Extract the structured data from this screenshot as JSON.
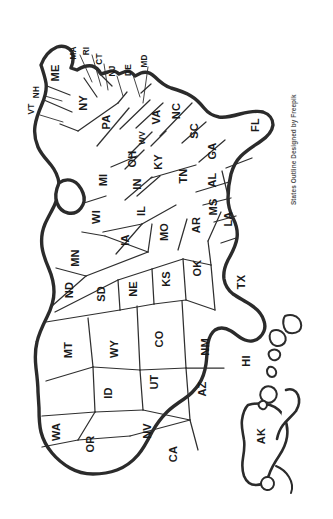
{
  "document": {
    "title": "United States Outline Map",
    "orientation": "rotated-90-clockwise",
    "background_color": "#ffffff",
    "outline_color": "#2b2b2b",
    "state_border_color": "#2f2f2f",
    "label_color": "#1a1a1a"
  },
  "attribution": {
    "text": "States Outline Designed by Freepik",
    "color": "#555555"
  },
  "map": {
    "caption": "Blank outline map of the United States with all fifty state abbreviations",
    "states": [
      {
        "abbr": "ME",
        "x": 55,
        "y": 73,
        "size": "normal",
        "leader": false
      },
      {
        "abbr": "NH",
        "x": 36,
        "y": 92,
        "size": "small",
        "leader": true
      },
      {
        "abbr": "VT",
        "x": 31,
        "y": 109,
        "size": "small",
        "leader": true
      },
      {
        "abbr": "MA",
        "x": 73,
        "y": 53,
        "size": "small",
        "leader": true
      },
      {
        "abbr": "RI",
        "x": 86,
        "y": 51,
        "size": "small",
        "leader": true
      },
      {
        "abbr": "CT",
        "x": 99,
        "y": 59,
        "size": "small",
        "leader": true
      },
      {
        "abbr": "NY",
        "x": 83,
        "y": 103,
        "size": "normal",
        "leader": false
      },
      {
        "abbr": "NJ",
        "x": 112,
        "y": 71,
        "size": "small",
        "leader": true
      },
      {
        "abbr": "PA",
        "x": 106,
        "y": 122,
        "size": "normal",
        "leader": false
      },
      {
        "abbr": "DE",
        "x": 128,
        "y": 70,
        "size": "small",
        "leader": true
      },
      {
        "abbr": "MD",
        "x": 144,
        "y": 61,
        "size": "small",
        "leader": true
      },
      {
        "abbr": "WV",
        "x": 142,
        "y": 138,
        "size": "small",
        "leader": false
      },
      {
        "abbr": "VA",
        "x": 156,
        "y": 117,
        "size": "normal",
        "leader": false
      },
      {
        "abbr": "NC",
        "x": 176,
        "y": 111,
        "size": "normal",
        "leader": false
      },
      {
        "abbr": "SC",
        "x": 194,
        "y": 131,
        "size": "normal",
        "leader": false
      },
      {
        "abbr": "GA",
        "x": 212,
        "y": 151,
        "size": "normal",
        "leader": false
      },
      {
        "abbr": "FL",
        "x": 255,
        "y": 125,
        "size": "normal",
        "leader": false
      },
      {
        "abbr": "OH",
        "x": 132,
        "y": 159,
        "size": "normal",
        "leader": false
      },
      {
        "abbr": "KY",
        "x": 158,
        "y": 162,
        "size": "normal",
        "leader": false
      },
      {
        "abbr": "TN",
        "x": 183,
        "y": 176,
        "size": "normal",
        "leader": false
      },
      {
        "abbr": "AL",
        "x": 212,
        "y": 180,
        "size": "normal",
        "leader": false
      },
      {
        "abbr": "MS",
        "x": 213,
        "y": 207,
        "size": "normal",
        "leader": false
      },
      {
        "abbr": "MI",
        "x": 103,
        "y": 180,
        "size": "normal",
        "leader": false
      },
      {
        "abbr": "IN",
        "x": 137,
        "y": 184,
        "size": "normal",
        "leader": false
      },
      {
        "abbr": "IL",
        "x": 141,
        "y": 211,
        "size": "normal",
        "leader": false
      },
      {
        "abbr": "WI",
        "x": 96,
        "y": 217,
        "size": "normal",
        "leader": false
      },
      {
        "abbr": "IA",
        "x": 125,
        "y": 240,
        "size": "normal",
        "leader": false
      },
      {
        "abbr": "MO",
        "x": 164,
        "y": 232,
        "size": "normal",
        "leader": false
      },
      {
        "abbr": "AR",
        "x": 196,
        "y": 225,
        "size": "normal",
        "leader": false
      },
      {
        "abbr": "LA",
        "x": 228,
        "y": 219,
        "size": "normal",
        "leader": false
      },
      {
        "abbr": "MN",
        "x": 75,
        "y": 258,
        "size": "normal",
        "leader": false
      },
      {
        "abbr": "ND",
        "x": 69,
        "y": 290,
        "size": "normal",
        "leader": false
      },
      {
        "abbr": "SD",
        "x": 101,
        "y": 294,
        "size": "normal",
        "leader": false
      },
      {
        "abbr": "NE",
        "x": 133,
        "y": 289,
        "size": "normal",
        "leader": false
      },
      {
        "abbr": "KS",
        "x": 166,
        "y": 279,
        "size": "normal",
        "leader": false
      },
      {
        "abbr": "OK",
        "x": 197,
        "y": 268,
        "size": "normal",
        "leader": false
      },
      {
        "abbr": "TX",
        "x": 241,
        "y": 282,
        "size": "normal",
        "leader": false
      },
      {
        "abbr": "MT",
        "x": 68,
        "y": 350,
        "size": "normal",
        "leader": false
      },
      {
        "abbr": "WY",
        "x": 114,
        "y": 349,
        "size": "normal",
        "leader": false
      },
      {
        "abbr": "CO",
        "x": 159,
        "y": 339,
        "size": "normal",
        "leader": false
      },
      {
        "abbr": "NM",
        "x": 205,
        "y": 347,
        "size": "normal",
        "leader": false
      },
      {
        "abbr": "ID",
        "x": 108,
        "y": 393,
        "size": "normal",
        "leader": false
      },
      {
        "abbr": "UT",
        "x": 154,
        "y": 382,
        "size": "normal",
        "leader": false
      },
      {
        "abbr": "AZ",
        "x": 202,
        "y": 389,
        "size": "normal",
        "leader": false
      },
      {
        "abbr": "WA",
        "x": 56,
        "y": 432,
        "size": "normal",
        "leader": false
      },
      {
        "abbr": "OR",
        "x": 90,
        "y": 444,
        "size": "normal",
        "leader": false
      },
      {
        "abbr": "NV",
        "x": 147,
        "y": 431,
        "size": "normal",
        "leader": false
      },
      {
        "abbr": "CA",
        "x": 173,
        "y": 454,
        "size": "normal",
        "leader": false
      },
      {
        "abbr": "AK",
        "x": 261,
        "y": 436,
        "size": "normal",
        "leader": false
      },
      {
        "abbr": "HI",
        "x": 246,
        "y": 361,
        "size": "normal",
        "leader": false
      }
    ]
  }
}
